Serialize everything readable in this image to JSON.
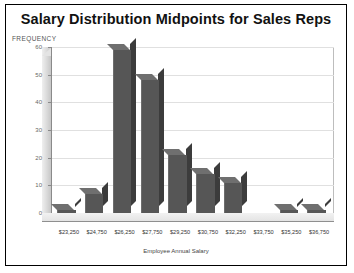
{
  "chart_data": {
    "type": "bar",
    "title": "Salary Distribution Midpoints for Sales Reps",
    "xlabel": "Employee Annual Salary",
    "ylabel": "FREQUENCY",
    "categories": [
      "$23,250",
      "$24,750",
      "$26,250",
      "$27,750",
      "$29,250",
      "$30,750",
      "$32,250",
      "$33,750",
      "$35,250",
      "$36,750"
    ],
    "values": [
      1,
      7,
      59,
      48,
      21,
      14,
      11,
      0,
      1,
      1
    ],
    "ylim": [
      0,
      60
    ],
    "yticks": [
      0,
      10,
      20,
      30,
      40,
      50,
      60
    ],
    "ytick_labels": [
      "0",
      "10",
      "20",
      "30",
      "40",
      "50",
      "60"
    ],
    "grid": true,
    "legend": false,
    "style": "3d-column",
    "bar_color": "#565656",
    "bar_side_color": "#3c3c3c",
    "bar_top_color": "#6f6f6f",
    "grid_color": "#e0e0e0",
    "background_color": "#ffffff",
    "border_color": "#000000"
  }
}
